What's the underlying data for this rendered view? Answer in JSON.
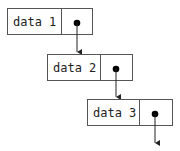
{
  "diagram": {
    "type": "linked-list",
    "nodes": [
      {
        "label": "data 1"
      },
      {
        "label": "data 2"
      },
      {
        "label": "data 3"
      }
    ],
    "colors": {
      "stroke": "#555555",
      "dot": "#000000",
      "text": "#222222"
    }
  }
}
